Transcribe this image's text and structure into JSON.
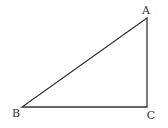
{
  "diagram": {
    "type": "right-triangle",
    "stroke_color": "#333333",
    "vertices": [
      {
        "label": "A",
        "x": 147,
        "y": 18,
        "label_x": 146,
        "label_y": 14
      },
      {
        "label": "B",
        "x": 22,
        "y": 107,
        "label_x": 16,
        "label_y": 117
      },
      {
        "label": "C",
        "x": 147,
        "y": 107,
        "label_x": 151,
        "label_y": 119
      }
    ],
    "right_angle_at": "C"
  }
}
